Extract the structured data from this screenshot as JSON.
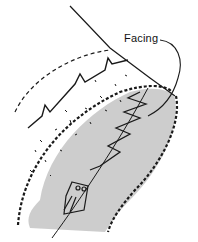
{
  "diagram": {
    "labels": [
      {
        "id": "facing",
        "text": "Facing"
      }
    ],
    "colors": {
      "line": "#1a1a1a",
      "fabric_shade": "#bdbdbd",
      "background": "#ffffff"
    }
  }
}
